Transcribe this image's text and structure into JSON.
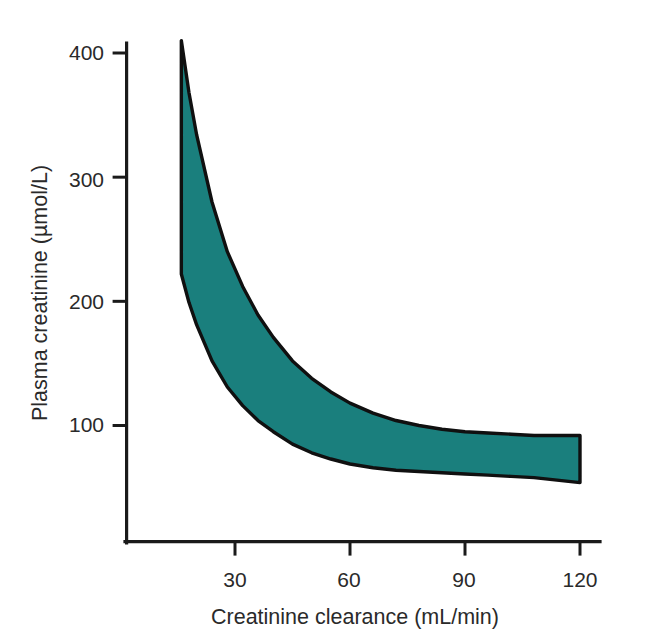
{
  "figure": {
    "background_color": "#ffffff",
    "band_fill_color": "#1a7f7d",
    "band_stroke_color": "#101010",
    "axis_color": "#1a1a1a",
    "text_color": "#2a2a2a"
  },
  "chart_data": {
    "type": "area",
    "title": "",
    "subtitle": "",
    "xlabel": "Creatinine clearance (mL/min)",
    "ylabel": "Plasma creatinine (µmol/L)",
    "xlim": [
      0,
      125
    ],
    "ylim": [
      0,
      420
    ],
    "xticks": [
      30,
      60,
      90,
      120
    ],
    "xticklabels": [
      "30",
      "60",
      "90",
      "120"
    ],
    "yticks": [
      100,
      200,
      300,
      400
    ],
    "yticklabels": [
      "100",
      "200",
      "300",
      "400"
    ],
    "grid": false,
    "legend": null,
    "annotations": [],
    "x": [
      16,
      18,
      20,
      24,
      28,
      32,
      36,
      40,
      45,
      50,
      55,
      60,
      66,
      72,
      78,
      84,
      90,
      96,
      102,
      108,
      114,
      120
    ],
    "series": [
      {
        "name": "Upper limit",
        "values": [
          410,
          368,
          334,
          280,
          240,
          212,
          189,
          171,
          152,
          138,
          127,
          118,
          110,
          104,
          100,
          97,
          95,
          94,
          93,
          92,
          92,
          92
        ]
      },
      {
        "name": "Lower limit",
        "values": [
          222,
          199,
          181,
          152,
          131,
          116,
          104,
          95,
          85,
          78,
          73,
          69,
          66,
          64,
          63,
          62,
          61,
          60,
          59,
          58,
          56,
          54
        ]
      }
    ]
  },
  "axes": {
    "y_axis_name": "plasma-creatinine-axis",
    "x_axis_name": "creatinine-clearance-axis"
  }
}
